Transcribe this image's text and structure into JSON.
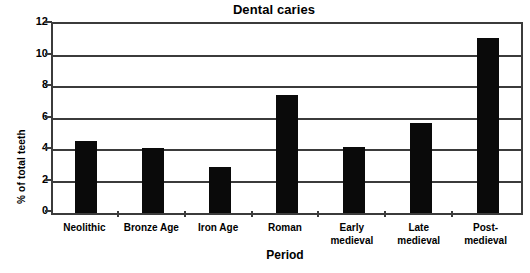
{
  "chart_data": {
    "type": "bar",
    "title": "Dental caries",
    "xlabel": "Period",
    "ylabel": "% of total teeth",
    "categories": [
      "Neolithic",
      "Bronze Age",
      "Iron Age",
      "Roman",
      "Early medieval",
      "Late medieval",
      "Post-medieval"
    ],
    "category_labels_multiline": [
      "Neolithic",
      "Bronze Age",
      "Iron Age",
      "Roman",
      "Early\nmedieval",
      "Late\nmedieval",
      "Post-\nmedieval"
    ],
    "values": [
      4.6,
      4.1,
      2.9,
      7.5,
      4.2,
      5.7,
      11.1
    ],
    "ylim": [
      0,
      12
    ],
    "yticks": [
      0,
      2,
      4,
      6,
      8,
      10,
      12
    ],
    "ytick_labels": [
      "0",
      "2",
      "4",
      "6",
      "8",
      "10",
      "12"
    ],
    "grid": true,
    "grid_axis": "y",
    "legend": false,
    "bar_color": "#0a0a0a",
    "axis_color": "#3b3b3b",
    "background_color": "#ffffff"
  }
}
